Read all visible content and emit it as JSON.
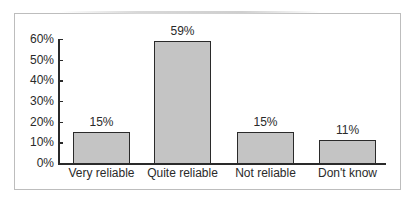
{
  "chart_data": {
    "type": "bar",
    "title": "",
    "xlabel": "",
    "ylabel": "",
    "categories": [
      "Very reliable",
      "Quite reliable",
      "Not reliable",
      "Don't know"
    ],
    "values": [
      15,
      59,
      15,
      11
    ],
    "value_labels": [
      "15%",
      "59%",
      "15%",
      "11%"
    ],
    "yticks": [
      "0%",
      "10%",
      "20%",
      "30%",
      "40%",
      "50%",
      "60%"
    ],
    "ylim": [
      0,
      60
    ],
    "grid": false,
    "legend": null,
    "bar_color": "#c4c4c4",
    "bar_edge_color": "#2a2a2a"
  }
}
